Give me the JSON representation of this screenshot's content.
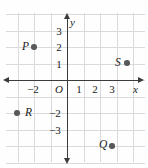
{
  "figure": {
    "kind": "coordinate-plane",
    "axis_labels": {
      "x": "x",
      "y": "y",
      "origin": "O"
    },
    "x_ticks": [
      {
        "label": "−2",
        "value": -2,
        "px": 33
      },
      {
        "label": "1",
        "value": 1,
        "px": 79
      },
      {
        "label": "2",
        "value": 2,
        "px": 95
      },
      {
        "label": "3",
        "value": 3,
        "px": 112
      }
    ],
    "y_ticks": [
      {
        "label": "3",
        "value": 3,
        "px": 31
      },
      {
        "label": "2",
        "value": 2,
        "px": 47
      },
      {
        "label": "1",
        "value": 1,
        "px": 64
      },
      {
        "label": "−2",
        "value": -2,
        "px": 113
      },
      {
        "label": "−3",
        "value": -3,
        "px": 130
      }
    ],
    "points": [
      {
        "name": "P",
        "label": "P",
        "x": -2,
        "y": 2,
        "dot_px": [
          34,
          47
        ],
        "label_px": [
          22,
          41
        ],
        "label_side": "left"
      },
      {
        "name": "S",
        "label": "S",
        "x": 3.6,
        "y": 1,
        "dot_px": [
          127,
          63
        ],
        "label_px": [
          115,
          57
        ],
        "label_side": "left"
      },
      {
        "name": "R",
        "label": "R",
        "x": -3,
        "y": -2,
        "dot_px": [
          17,
          113
        ],
        "label_px": [
          25,
          107
        ],
        "label_side": "right"
      },
      {
        "name": "Q",
        "label": "Q",
        "x": 3,
        "y": -4,
        "dot_px": [
          112,
          146
        ],
        "label_px": [
          99,
          139
        ],
        "label_side": "left"
      }
    ],
    "grid": {
      "spacing_px": 16.5,
      "origin_px": [
        67,
        80
      ],
      "x_range_px": [
        6,
        145
      ],
      "y_range_px": [
        13,
        162
      ]
    },
    "colors": {
      "grid": "#d9dadb",
      "axis": "#3b3b3b",
      "point": "#58595b",
      "text": "#1a1a1a",
      "background": "#fefefe"
    }
  }
}
